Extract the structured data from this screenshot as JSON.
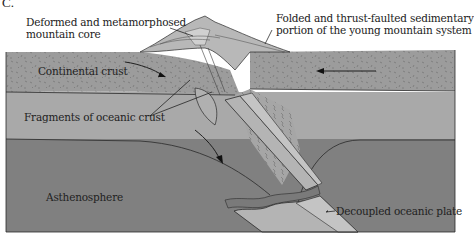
{
  "figure": {
    "panel_letter": "C.",
    "labels": {
      "mountain_core": [
        "Deformed and metamorphosed",
        "mountain core"
      ],
      "sedimentary": [
        "Folded and thrust-faulted sedimentary",
        "portion of the young mountain system"
      ],
      "continental_crust": "Continental crust",
      "oceanic_fragments": "Fragments of oceanic crust",
      "asthenosphere": "Asthenosphere",
      "decoupled_plate": "Decoupled oceanic plate"
    },
    "colors": {
      "crust": "#9c9c9c",
      "lithosphere": "#a9a9a9",
      "asthenosphere": "#808080",
      "slab": "#b4b4b4",
      "slab_edge": "#c4c4c4",
      "mountain": "#b8b8b8",
      "line": "#2a2a2a"
    }
  }
}
